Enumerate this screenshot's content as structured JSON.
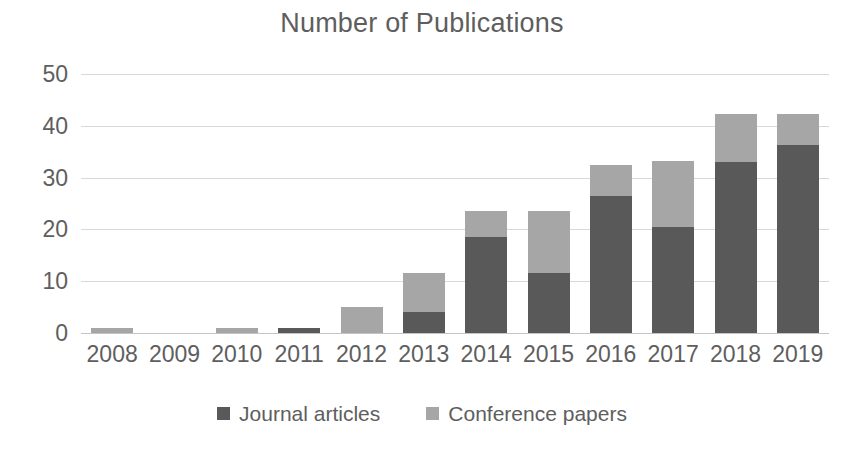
{
  "chart_data": {
    "type": "bar",
    "subtype": "stacked-column",
    "title": "Number of Publications",
    "xlabel": "",
    "ylabel": "",
    "categories": [
      "2008",
      "2009",
      "2010",
      "2011",
      "2012",
      "2013",
      "2014",
      "2015",
      "2016",
      "2017",
      "2018",
      "2019"
    ],
    "series": [
      {
        "name": "Journal articles",
        "color": "#595959",
        "values": [
          0,
          0,
          0,
          1,
          0,
          4,
          18.5,
          11.5,
          26.5,
          20.5,
          33,
          36.3
        ]
      },
      {
        "name": "Conference papers",
        "color": "#a6a6a6",
        "values": [
          1,
          0,
          1,
          0,
          5,
          7.5,
          5,
          12,
          6,
          12.8,
          9.3,
          6
        ]
      }
    ],
    "totals": [
      1,
      0,
      1,
      1,
      5,
      11.5,
      23.5,
      23.5,
      32.5,
      33.3,
      42.3,
      42.3
    ],
    "ylim": [
      0,
      50
    ],
    "ytick_labels": [
      "0",
      "10",
      "20",
      "30",
      "40",
      "50"
    ],
    "ytick_values": [
      0,
      10,
      20,
      30,
      40,
      50
    ],
    "grid": true,
    "legend_position": "bottom",
    "stack_order": [
      "Journal articles",
      "Conference papers"
    ]
  },
  "legend": {
    "items": [
      {
        "label": "Journal articles",
        "color": "#595959"
      },
      {
        "label": "Conference papers",
        "color": "#a6a6a6"
      }
    ]
  }
}
